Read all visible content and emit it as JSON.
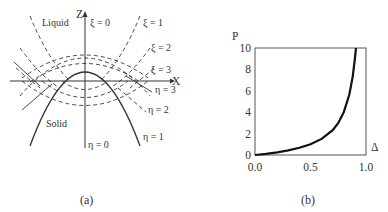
{
  "panel_a": {
    "caption": "(a)",
    "axis_z_label": "Z",
    "axis_x_label": "X",
    "region_top": "Liquid",
    "region_bottom": "Solid",
    "xi_labels": [
      "ξ = 0",
      "ξ = 1",
      "ξ = 2",
      "ξ = 3"
    ],
    "eta_labels": [
      "η = 0",
      "η = 1",
      "η = 2",
      "η = 3"
    ]
  },
  "panel_b": {
    "caption": "(b)",
    "y_label": "P",
    "x_label": "Δ",
    "y_ticks": [
      "0",
      "2",
      "4",
      "6",
      "8",
      "10"
    ],
    "x_ticks": [
      "0.0",
      "0.5",
      "1.0"
    ]
  },
  "chart_data": {
    "type": "line",
    "title": "",
    "xlabel": "Δ",
    "ylabel": "P",
    "xlim": [
      0.0,
      1.0
    ],
    "ylim": [
      0,
      10
    ],
    "grid": false,
    "x": [
      0.0,
      0.1,
      0.2,
      0.3,
      0.4,
      0.5,
      0.6,
      0.7,
      0.75,
      0.8,
      0.85,
      0.88,
      0.9,
      0.91
    ],
    "series": [
      {
        "name": "P(Δ)",
        "values": [
          0.0,
          0.11,
          0.25,
          0.43,
          0.67,
          1.0,
          1.5,
          2.33,
          3.0,
          4.0,
          5.67,
          7.33,
          9.0,
          10.0
        ]
      }
    ]
  }
}
